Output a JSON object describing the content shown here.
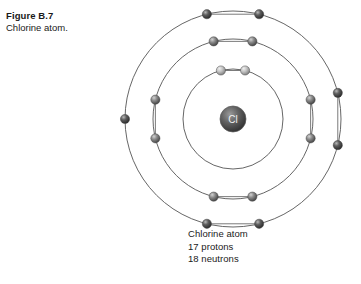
{
  "figure": {
    "number": "Figure B.7",
    "caption": "Chlorine atom."
  },
  "diagram": {
    "nucleus_label": "Cl",
    "center_x": 233,
    "center_y": 119,
    "nucleus_radius": 13,
    "electron_radius": 4.6,
    "shell_stroke": "#555555",
    "shell_stroke_width": 0.9,
    "nucleus_fill_dark": "#3a3a3a",
    "nucleus_fill_light": "#8e8e8e",
    "electron_fill_dark": "#2e2e2e",
    "electron_fill_mid": "#6e6e6e",
    "electron_fill_light": "#d8d8d8",
    "chord_stroke": "#6b6b6b",
    "shells": [
      {
        "name": "inner-shell",
        "index": 1,
        "radius": 50,
        "electron_count": 2,
        "tone": "light",
        "electron_angles": [
          -104,
          -76
        ]
      },
      {
        "name": "middle-shell",
        "index": 2,
        "radius": 80,
        "electron_count": 8,
        "tone": "mid",
        "electron_angles": [
          -104,
          -76,
          -14,
          14,
          76,
          104,
          166,
          194
        ]
      },
      {
        "name": "outer-shell",
        "index": 3,
        "radius": 108,
        "electron_count": 7,
        "tone": "dark",
        "electron_angles": [
          -104,
          -76,
          -14,
          14,
          76,
          104,
          180
        ]
      }
    ],
    "chords": [
      {
        "shell": 1,
        "from": -104,
        "to": -76
      },
      {
        "shell": 2,
        "from": -104,
        "to": -76
      },
      {
        "shell": 2,
        "from": 76,
        "to": 104
      },
      {
        "shell": 2,
        "from": -14,
        "to": 14
      },
      {
        "shell": 2,
        "from": 166,
        "to": 194
      },
      {
        "shell": 3,
        "from": -104,
        "to": -76
      },
      {
        "shell": 3,
        "from": 76,
        "to": 104
      },
      {
        "shell": 3,
        "from": -14,
        "to": 14
      }
    ]
  },
  "atom_caption": {
    "line1": "Chlorine atom",
    "line2": "17 protons",
    "line3": "18 neutrons"
  }
}
